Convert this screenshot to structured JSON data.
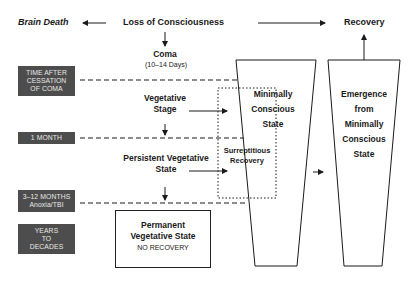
{
  "diagram": {
    "top_row": {
      "brain_death": "Brain Death",
      "loss_of_consciousness": "Loss of Consciousness",
      "recovery": "Recovery"
    },
    "states": {
      "coma": "Coma",
      "coma_duration": "(10–14 Days)",
      "vegetative_stage_line1": "Vegetative",
      "vegetative_stage_line2": "Stage",
      "persistent_vs_line1": "Persistent Vegetative",
      "persistent_vs_line2": "State",
      "permanent_vs_line1": "Permanent",
      "permanent_vs_line2": "Vegetative State",
      "permanent_vs_note": "NO RECOVERY",
      "surreptitious_line1": "Surreptitious",
      "surreptitious_line2": "Recovery",
      "mcs_line1": "Minimally",
      "mcs_line2": "Conscious",
      "mcs_line3": "State",
      "emcs_line1": "Emergence",
      "emcs_line2": "from",
      "emcs_line3": "Minimally",
      "emcs_line4": "Conscious",
      "emcs_line5": "State"
    },
    "timeline": [
      {
        "lines": [
          "TIME AFTER",
          "CESSATION",
          "OF COMA"
        ]
      },
      {
        "lines": [
          "1 MONTH"
        ]
      },
      {
        "lines": [
          "3–12 MONTHS",
          "Anoxia/TBI"
        ]
      },
      {
        "lines": [
          "YEARS",
          "TO",
          "DECADES"
        ]
      }
    ],
    "colors": {
      "timeline_box": "#4d4d4d",
      "timeline_text": "#e8e8e8",
      "line": "#1a1a1a"
    }
  }
}
